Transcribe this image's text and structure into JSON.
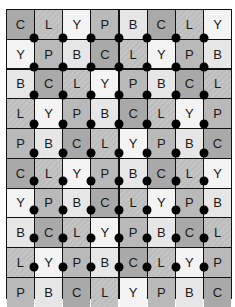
{
  "caption": "figure caption (clipped)",
  "grid": {
    "columns": 8,
    "rows": [
      [
        "C",
        "L",
        "Y",
        "P",
        "B",
        "C",
        "L",
        "Y"
      ],
      [
        "Y",
        "P",
        "B",
        "C",
        "L",
        "Y",
        "P",
        "B"
      ],
      [
        "B",
        "C",
        "L",
        "Y",
        "P",
        "B",
        "C",
        "L"
      ],
      [
        "L",
        "Y",
        "P",
        "B",
        "C",
        "L",
        "Y",
        "P"
      ],
      [
        "P",
        "B",
        "C",
        "L",
        "Y",
        "P",
        "B",
        "C"
      ],
      [
        "C",
        "L",
        "Y",
        "P",
        "B",
        "C",
        "L",
        "Y"
      ],
      [
        "Y",
        "P",
        "B",
        "C",
        "L",
        "Y",
        "P",
        "B"
      ],
      [
        "B",
        "C",
        "L",
        "Y",
        "P",
        "B",
        "C",
        "L"
      ],
      [
        "L",
        "Y",
        "P",
        "B",
        "C",
        "L",
        "Y",
        "P"
      ],
      [
        "P",
        "B",
        "C",
        "L",
        "Y",
        "P",
        "B",
        "C"
      ]
    ]
  },
  "shades": {
    "C": "#a9a9a9",
    "L": "#c0c0c0",
    "Y": "#f3f3f3",
    "P": "#b9b9b9",
    "B": "#e6e6e6"
  },
  "dot_color": "#000000"
}
